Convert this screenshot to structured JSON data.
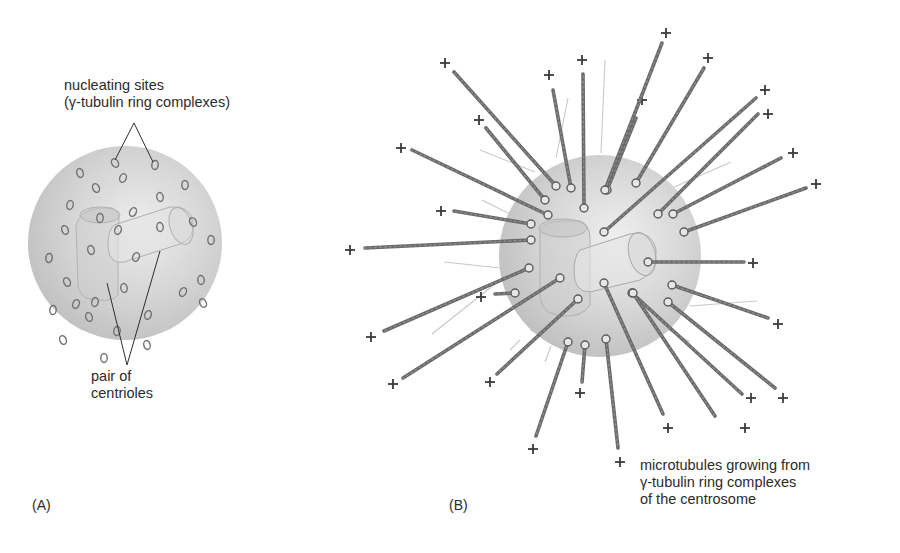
{
  "figure": {
    "panel_a": {
      "tag": "(A)",
      "sphere": {
        "cx": 125,
        "cy": 243,
        "r": 97
      },
      "labels": {
        "nucleating_line1": "nucleating sites",
        "nucleating_line2": "(γ-tubulin ring complexes)",
        "centrioles_line1": "pair of",
        "centrioles_line2": "centrioles"
      },
      "rings": [
        [
          115,
          163
        ],
        [
          155,
          165
        ],
        [
          80,
          173
        ],
        [
          123,
          178
        ],
        [
          185,
          185
        ],
        [
          96,
          188
        ],
        [
          70,
          205
        ],
        [
          160,
          197
        ],
        [
          133,
          212
        ],
        [
          100,
          218
        ],
        [
          65,
          230
        ],
        [
          118,
          230
        ],
        [
          160,
          227
        ],
        [
          193,
          222
        ],
        [
          49,
          258
        ],
        [
          91,
          250
        ],
        [
          136,
          257
        ],
        [
          211,
          240
        ],
        [
          67,
          282
        ],
        [
          95,
          302
        ],
        [
          124,
          288
        ],
        [
          183,
          292
        ],
        [
          53,
          310
        ],
        [
          89,
          317
        ],
        [
          148,
          315
        ],
        [
          201,
          280
        ],
        [
          203,
          303
        ],
        [
          117,
          331
        ],
        [
          147,
          345
        ],
        [
          76,
          304
        ],
        [
          104,
          358
        ],
        [
          63,
          340
        ]
      ]
    },
    "panel_b": {
      "tag": "(B)",
      "sphere": {
        "cx": 600,
        "cy": 256,
        "r": 101
      },
      "caption_line1": "microtubules growing from",
      "caption_line2": "γ-tubulin ring complexes",
      "caption_line3": "of the centrosome",
      "microtubules": [
        {
          "x1": 556,
          "y1": 186,
          "x2": 454,
          "y2": 72,
          "px": 445,
          "py": 63
        },
        {
          "x1": 571,
          "y1": 188,
          "x2": 553,
          "y2": 90,
          "px": 549,
          "py": 75
        },
        {
          "x1": 584,
          "y1": 208,
          "x2": 583,
          "y2": 74,
          "px": 582,
          "py": 60
        },
        {
          "x1": 545,
          "y1": 200,
          "x2": 486,
          "y2": 128,
          "px": 479,
          "py": 120
        },
        {
          "x1": 607,
          "y1": 190,
          "x2": 636,
          "y2": 118,
          "px": 642,
          "py": 100
        },
        {
          "x1": 605,
          "y1": 190,
          "x2": 662,
          "y2": 43,
          "px": 666,
          "py": 33
        },
        {
          "x1": 636,
          "y1": 183,
          "x2": 704,
          "y2": 68,
          "px": 708,
          "py": 58
        },
        {
          "x1": 548,
          "y1": 215,
          "x2": 412,
          "y2": 150,
          "px": 401,
          "py": 148
        },
        {
          "x1": 531,
          "y1": 224,
          "x2": 454,
          "y2": 211,
          "px": 441,
          "py": 211
        },
        {
          "x1": 531,
          "y1": 240,
          "x2": 365,
          "y2": 248,
          "px": 350,
          "py": 250
        },
        {
          "x1": 604,
          "y1": 232,
          "x2": 756,
          "y2": 98,
          "px": 765,
          "py": 90
        },
        {
          "x1": 658,
          "y1": 214,
          "x2": 758,
          "y2": 114,
          "px": 768,
          "py": 114
        },
        {
          "x1": 673,
          "y1": 214,
          "x2": 781,
          "y2": 158,
          "px": 793,
          "py": 153
        },
        {
          "x1": 684,
          "y1": 232,
          "x2": 806,
          "y2": 188,
          "px": 816,
          "py": 184
        },
        {
          "x1": 648,
          "y1": 262,
          "x2": 744,
          "y2": 262,
          "px": 753,
          "py": 263
        },
        {
          "x1": 672,
          "y1": 285,
          "x2": 768,
          "y2": 318,
          "px": 778,
          "py": 324
        },
        {
          "x1": 632,
          "y1": 293,
          "x2": 742,
          "y2": 394,
          "px": 751,
          "py": 398
        },
        {
          "x1": 604,
          "y1": 283,
          "x2": 663,
          "y2": 414,
          "px": 668,
          "py": 428
        },
        {
          "x1": 668,
          "y1": 302,
          "x2": 775,
          "y2": 388,
          "px": 783,
          "py": 398
        },
        {
          "x1": 633,
          "y1": 293,
          "x2": 715,
          "y2": 416,
          "px": 745,
          "py": 428
        },
        {
          "x1": 529,
          "y1": 268,
          "x2": 384,
          "y2": 331,
          "px": 371,
          "py": 337
        },
        {
          "x1": 560,
          "y1": 278,
          "x2": 403,
          "y2": 378,
          "px": 393,
          "py": 384
        },
        {
          "x1": 578,
          "y1": 299,
          "x2": 497,
          "y2": 374,
          "px": 490,
          "py": 382
        },
        {
          "x1": 568,
          "y1": 342,
          "x2": 536,
          "y2": 436,
          "px": 533,
          "py": 449
        },
        {
          "x1": 585,
          "y1": 345,
          "x2": 582,
          "y2": 382,
          "px": 580,
          "py": 393
        },
        {
          "x1": 606,
          "y1": 339,
          "x2": 618,
          "y2": 448,
          "px": 620,
          "py": 462
        },
        {
          "x1": 515,
          "y1": 293,
          "x2": 495,
          "y2": 294,
          "px": 481,
          "py": 297
        },
        {
          "x1": 601,
          "y1": 283,
          "x2": 663,
          "y2": 414,
          "px": 0,
          "py": 0
        }
      ],
      "faint_lines": [
        [
          605,
          60,
          601,
          153
        ],
        [
          568,
          98,
          556,
          158
        ],
        [
          480,
          150,
          535,
          172
        ],
        [
          482,
          200,
          510,
          214
        ],
        [
          731,
          162,
          672,
          188
        ],
        [
          757,
          301,
          690,
          306
        ],
        [
          690,
          342,
          660,
          325
        ],
        [
          545,
          335,
          530,
          330
        ],
        [
          444,
          262,
          520,
          270
        ],
        [
          432,
          334,
          500,
          280
        ],
        [
          551,
          346,
          545,
          362
        ],
        [
          520,
          340,
          510,
          350
        ]
      ]
    }
  }
}
